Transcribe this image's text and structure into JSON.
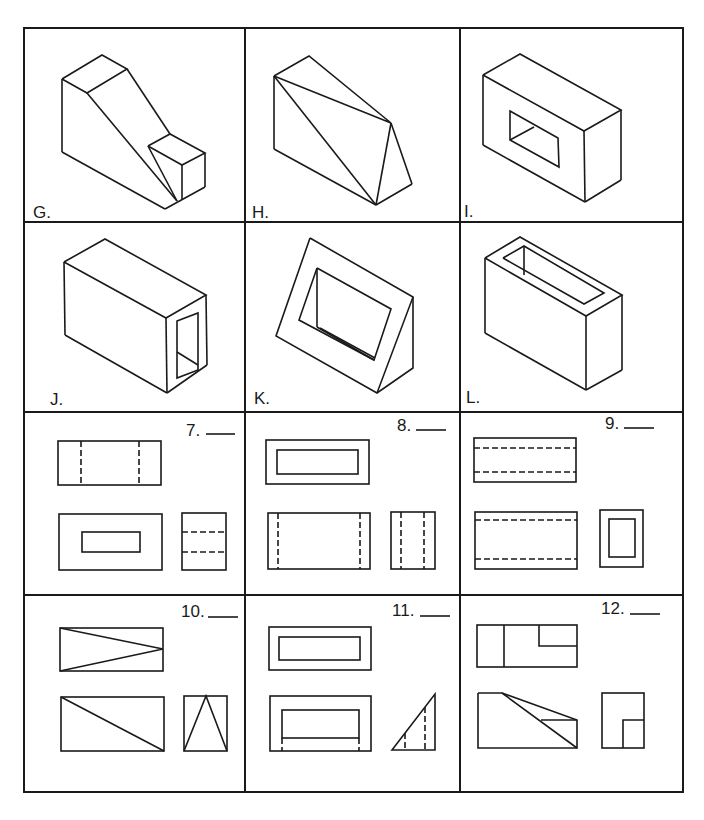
{
  "worksheet": {
    "pictorials": [
      {
        "label": "G.",
        "shape": "stepped-ramp-block"
      },
      {
        "label": "H.",
        "shape": "triangular-wedge-prism"
      },
      {
        "label": "I.",
        "shape": "block-with-rectangular-through-hole"
      },
      {
        "label": "J.",
        "shape": "rectangular-tube"
      },
      {
        "label": "K.",
        "shape": "triangular-frame-with-opening"
      },
      {
        "label": "L.",
        "shape": "open-top-box"
      }
    ],
    "problems": [
      {
        "number": "7.",
        "answer_blank": "____"
      },
      {
        "number": "8.",
        "answer_blank": "____"
      },
      {
        "number": "9.",
        "answer_blank": "____"
      },
      {
        "number": "10.",
        "answer_blank": "____"
      },
      {
        "number": "11.",
        "answer_blank": "____"
      },
      {
        "number": "12.",
        "answer_blank": "____"
      }
    ],
    "line_color": "#1a1a1a",
    "background": "#ffffff"
  }
}
